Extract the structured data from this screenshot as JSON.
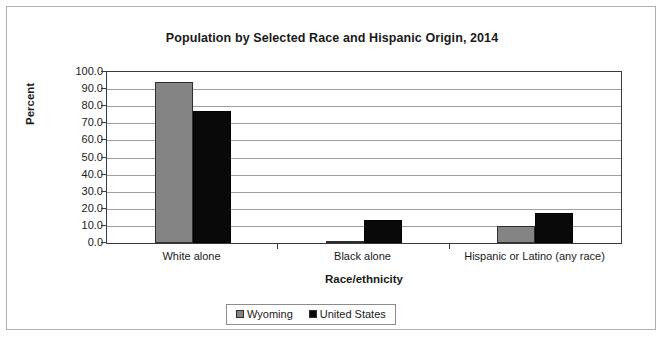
{
  "chart_data": {
    "type": "bar",
    "title": "Population by Selected Race and Hispanic Origin, 2014",
    "xlabel": "Race/ethnicity",
    "ylabel": "Percent",
    "categories": [
      "White alone",
      "Black alone",
      "Hispanic or Latino (any race)"
    ],
    "series": [
      {
        "name": "Wyoming",
        "color": "#848484",
        "values": [
          93.9,
          1.3,
          9.8
        ]
      },
      {
        "name": "United States",
        "color": "#090909",
        "values": [
          77.4,
          13.2,
          17.3
        ]
      }
    ],
    "ylim": [
      0,
      100
    ],
    "yticks": [
      "0.0",
      "10.0",
      "20.0",
      "30.0",
      "40.0",
      "50.0",
      "60.0",
      "70.0",
      "80.0",
      "90.0",
      "100.0"
    ],
    "ytick_step": 10,
    "grid": true,
    "legend_position": "bottom",
    "legend_entries": [
      "Wyoming",
      "United States"
    ]
  }
}
